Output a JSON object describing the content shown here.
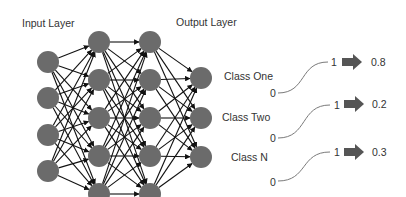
{
  "titles": {
    "input_layer": "Input Layer",
    "output_layer": "Output Layer"
  },
  "colors": {
    "node_fill": "#6b6b6b",
    "edge": "#111111",
    "arrow_fill": "#555555",
    "curve": "#7a7a7a",
    "text": "#333333"
  },
  "network": {
    "layers": [
      {
        "name": "input",
        "x": 48,
        "nodes_y": [
          62,
          98,
          135,
          171
        ]
      },
      {
        "name": "hidden-1",
        "x": 99,
        "nodes_y": [
          42,
          80,
          118,
          156,
          194
        ]
      },
      {
        "name": "hidden-2",
        "x": 150,
        "nodes_y": [
          42,
          80,
          118,
          156,
          194
        ]
      },
      {
        "name": "output",
        "x": 201,
        "nodes_y": [
          78,
          118,
          157
        ]
      }
    ],
    "node_radius": 11
  },
  "classes": [
    {
      "label": "Class One",
      "low": "0",
      "high": "1",
      "probability": "0.8"
    },
    {
      "label": "Class Two",
      "low": "0",
      "high": "1",
      "probability": "0.2"
    },
    {
      "label": "Class N",
      "low": "0",
      "high": "1",
      "probability": "0.3"
    }
  ]
}
